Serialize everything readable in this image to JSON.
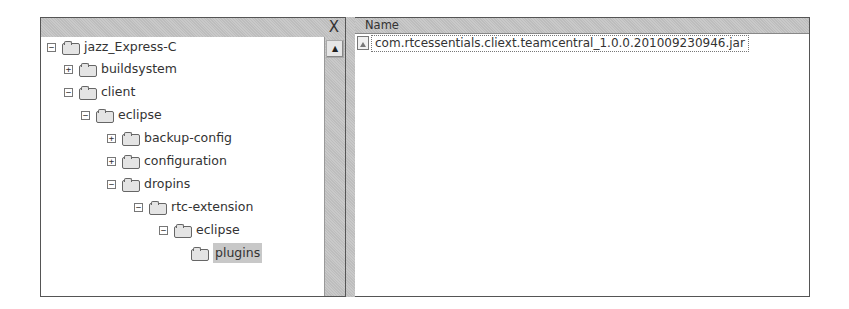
{
  "explorer": {
    "close_glyph": "X",
    "scroll_up_glyph": "▲",
    "tree": [
      {
        "label": "jazz_Express-C",
        "level": 0,
        "state": "expanded",
        "expander": "−"
      },
      {
        "label": "buildsystem",
        "level": 1,
        "state": "collapsed",
        "expander": "+"
      },
      {
        "label": "client",
        "level": 1,
        "state": "expanded",
        "expander": "−"
      },
      {
        "label": "eclipse",
        "level": 2,
        "state": "expanded",
        "expander": "−"
      },
      {
        "label": "backup-config",
        "level": 3,
        "state": "collapsed",
        "expander": "+"
      },
      {
        "label": "configuration",
        "level": 3,
        "state": "collapsed",
        "expander": "+"
      },
      {
        "label": "dropins",
        "level": 3,
        "state": "expanded",
        "expander": "−"
      },
      {
        "label": "rtc-extension",
        "level": 4,
        "state": "expanded",
        "expander": "−"
      },
      {
        "label": "eclipse",
        "level": 5,
        "state": "expanded",
        "expander": "−"
      },
      {
        "label": "plugins",
        "level": 6,
        "state": "selected",
        "expander": ""
      }
    ]
  },
  "file_list": {
    "column_header": "Name",
    "files": [
      {
        "name": "com.rtcessentials.cliext.teamcentral_1.0.0.201009230946.jar",
        "icon": "jar-file-icon"
      }
    ]
  }
}
